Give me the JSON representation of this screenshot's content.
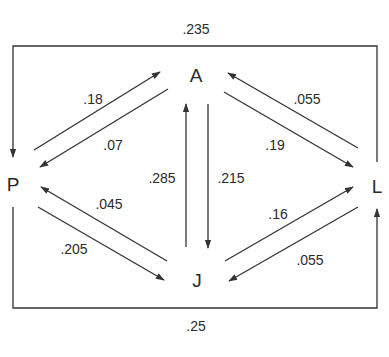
{
  "diagram": {
    "nodes": [
      {
        "id": "A",
        "label": "A"
      },
      {
        "id": "P",
        "label": "P"
      },
      {
        "id": "L",
        "label": "L"
      },
      {
        "id": "J",
        "label": "J"
      }
    ],
    "edges": [
      {
        "from": "P",
        "to": "A",
        "label": ".18"
      },
      {
        "from": "A",
        "to": "P",
        "label": ".07"
      },
      {
        "from": "L",
        "to": "A",
        "label": ".055"
      },
      {
        "from": "A",
        "to": "L",
        "label": ".19"
      },
      {
        "from": "J",
        "to": "A",
        "label": ".285"
      },
      {
        "from": "A",
        "to": "J",
        "label": ".215"
      },
      {
        "from": "J",
        "to": "P",
        "label": ".045"
      },
      {
        "from": "P",
        "to": "J",
        "label": ".205"
      },
      {
        "from": "J",
        "to": "L",
        "label": ".16"
      },
      {
        "from": "L",
        "to": "J",
        "label": ".055"
      },
      {
        "from": "L",
        "to": "P",
        "label": ".235"
      },
      {
        "from": "P",
        "to": "L",
        "label": ".25"
      }
    ]
  }
}
